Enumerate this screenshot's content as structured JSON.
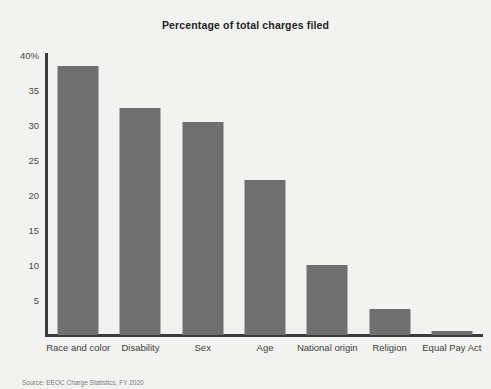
{
  "chart_data": {
    "type": "bar",
    "title": "Percentage of total charges filed",
    "xlabel": "",
    "ylabel": "",
    "categories": [
      "Race and color",
      "Disability",
      "Sex",
      "Age",
      "National origin",
      "Religion",
      "Equal Pay Act"
    ],
    "values": [
      38.4,
      32.4,
      30.4,
      22.2,
      10.0,
      3.7,
      0.6
    ],
    "ylim": [
      0,
      40
    ],
    "yticks": [
      5,
      10,
      15,
      20,
      25,
      30,
      35,
      40
    ],
    "ytick_labels": [
      "5",
      "10",
      "15",
      "20",
      "25",
      "30",
      "35",
      "40%"
    ],
    "grid": false,
    "legend": null,
    "bar_color": "#706f6f",
    "axis_color": "#3a3a3a",
    "background_color": "#f2f2f0"
  },
  "footer": {
    "source": "Source: EEOC Charge Statistics, FY 2020"
  }
}
